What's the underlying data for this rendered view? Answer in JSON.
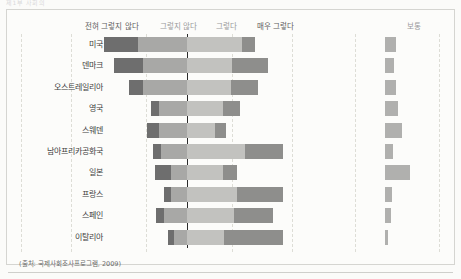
{
  "header": {
    "ghost_text": "제1부   사회의"
  },
  "source_note": "(출처: 국제사회조사프로그램, 2009)",
  "colors": {
    "strongly_disagree": "#6e6e6e",
    "disagree": "#a8a8a6",
    "agree": "#c2c2bf",
    "strongly_agree": "#8e8e8c",
    "neutral": "#b0b0ae",
    "zero_line": "#2a2a2a",
    "gridline": "#ddddd6",
    "paper": "#fbfbf9"
  },
  "chart_data": {
    "type": "bar",
    "subtype": "diverging-stacked-likert",
    "title": "",
    "xlabel": "",
    "ylabel": "",
    "grid": true,
    "legend_position": "top",
    "legend": [
      "전혀 그렇지 않다",
      "그렇지 않다",
      "그렇다",
      "매우 그렇다"
    ],
    "neutral_legend": "보통",
    "categories": [
      "미국",
      "덴마크",
      "오스트레일리아",
      "영국",
      "스웨덴",
      "남아프리카공화국",
      "일본",
      "프랑스",
      "스페인",
      "이탈리아"
    ],
    "series": [
      {
        "name": "전혀 그렇지 않다",
        "color": "#6e6e6e",
        "values": [
          21,
          18,
          9,
          5,
          8,
          5,
          10,
          4,
          5,
          4
        ]
      },
      {
        "name": "그렇지 않다",
        "color": "#a8a8a6",
        "values": [
          30,
          27,
          27,
          17,
          17,
          16,
          10,
          10,
          14,
          8
        ]
      },
      {
        "name": "그렇다",
        "color": "#c2c2bf",
        "values": [
          34,
          28,
          27,
          22,
          17,
          36,
          22,
          31,
          29,
          23
        ]
      },
      {
        "name": "매우 그렇다",
        "color": "#8e8e8c",
        "values": [
          8,
          22,
          17,
          11,
          7,
          23,
          9,
          28,
          24,
          36
        ]
      }
    ],
    "neutral_series": {
      "name": "보통",
      "color": "#b0b0ae",
      "values": [
        17,
        14,
        18,
        21,
        28,
        13,
        40,
        11,
        10,
        5
      ]
    },
    "axis": {
      "zero_anchor_label": "그렇지 않다 / 그렇다 경계",
      "xlim": [
        -60,
        80
      ]
    }
  }
}
